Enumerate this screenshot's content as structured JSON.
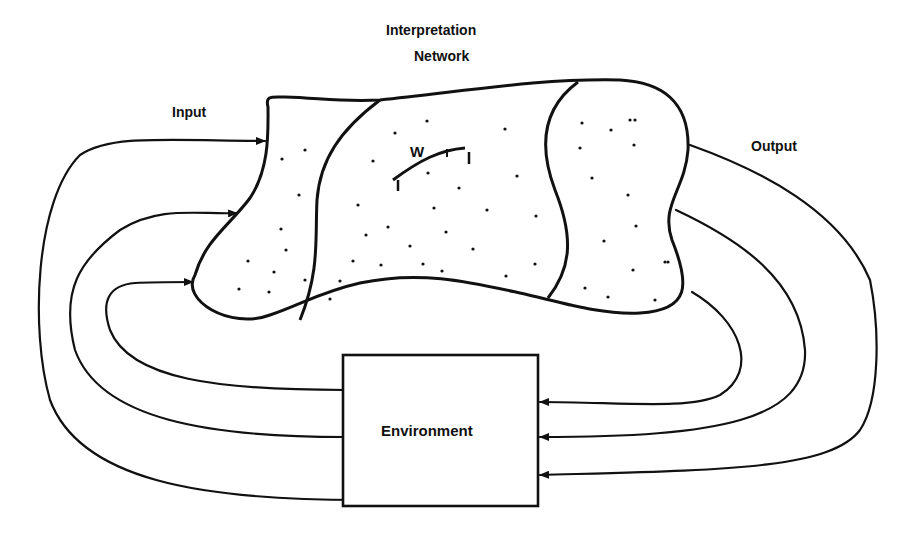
{
  "title": {
    "line1": "Interpretation",
    "line2": "Network"
  },
  "labels": {
    "input": "Input",
    "output": "Output",
    "environment": "Environment",
    "weight": "W",
    "weight_sub": "ij",
    "node_i": "i",
    "node_j": "j"
  },
  "colors": {
    "ink": "#111111",
    "background": "#ffffff"
  }
}
